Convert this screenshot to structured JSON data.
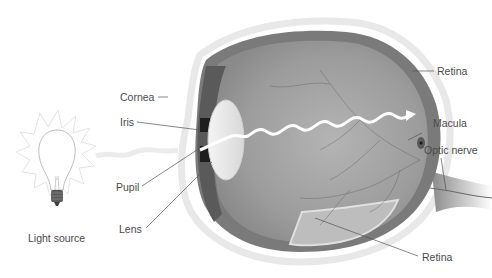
{
  "diagram": {
    "labels": {
      "cornea": "Cornea",
      "iris": "Iris",
      "pupil": "Pupil",
      "lens": "Lens",
      "retina_top": "Retina",
      "macula": "Macula",
      "optic_nerve": "Optic nerve",
      "retina_bottom": "Retina",
      "light_source": "Light source"
    },
    "colors": {
      "background": "#ffffff",
      "eye_interior": "#9a9a9a",
      "sclera_edge": "#6e6e6e",
      "lens": "#e8e8e8",
      "light_ray": "#ffffff",
      "label_text": "#4a4a4a",
      "leader_line": "#555555"
    }
  }
}
